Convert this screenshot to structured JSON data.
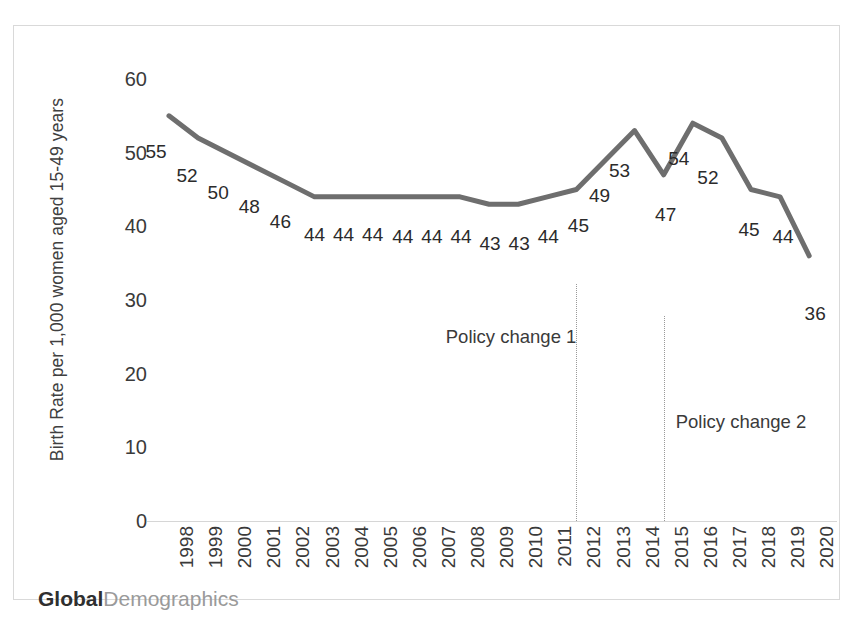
{
  "watermark": {
    "bold_part": "Global",
    "light_part": "Demographics"
  },
  "chart_data": {
    "type": "line",
    "title": "",
    "xlabel": "",
    "ylabel": "Birth Rate per 1,000 women aged 15-49 years",
    "ylim": [
      0,
      60
    ],
    "yticks": [
      0,
      10,
      20,
      30,
      40,
      50,
      60
    ],
    "ytick_labels": [
      "0",
      "10",
      "20",
      "30",
      "40",
      "50",
      "60"
    ],
    "grid": false,
    "legend": "none",
    "line_color": "#6e6e6e",
    "categories": [
      "1998",
      "1999",
      "2000",
      "2001",
      "2002",
      "2003",
      "2004",
      "2005",
      "2006",
      "2007",
      "2008",
      "2009",
      "2010",
      "2011",
      "2012",
      "2013",
      "2014",
      "2015",
      "2016",
      "2017",
      "2018",
      "2019",
      "2020"
    ],
    "values": [
      55,
      52,
      50,
      48,
      46,
      44,
      44,
      44,
      44,
      44,
      44,
      43,
      43,
      44,
      45,
      49,
      53,
      47,
      54,
      52,
      45,
      44,
      36
    ],
    "data_labels": [
      "55",
      "52",
      "50",
      "48",
      "46",
      "44",
      "44",
      "44",
      "44",
      "44",
      "44",
      "43",
      "43",
      "44",
      "45",
      "49",
      "53",
      "47",
      "54",
      "52",
      "45",
      "44",
      "36"
    ],
    "annotations": [
      {
        "text": "Policy change 1",
        "at_category": "2012",
        "kind": "vertical-dotted-line"
      },
      {
        "text": "Policy change 2",
        "at_category": "2015",
        "kind": "vertical-dotted-line"
      }
    ]
  }
}
